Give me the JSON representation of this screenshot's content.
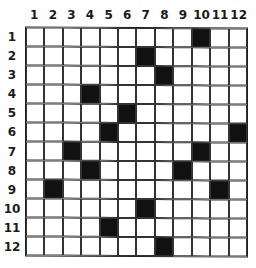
{
  "grid": {
    "rows": 12,
    "cols": 12,
    "column_labels": [
      "1",
      "2",
      "3",
      "4",
      "5",
      "6",
      "7",
      "8",
      "9",
      "10",
      "11",
      "12"
    ],
    "row_labels": [
      "1",
      "2",
      "3",
      "4",
      "5",
      "6",
      "7",
      "8",
      "9",
      "10",
      "11",
      "12"
    ],
    "filled_color": "#111111",
    "empty_color": "#ffffff",
    "filled_cells": [
      [
        1,
        10
      ],
      [
        2,
        7
      ],
      [
        3,
        8
      ],
      [
        4,
        4
      ],
      [
        5,
        6
      ],
      [
        6,
        5
      ],
      [
        6,
        12
      ],
      [
        7,
        3
      ],
      [
        7,
        10
      ],
      [
        8,
        4
      ],
      [
        8,
        9
      ],
      [
        9,
        2
      ],
      [
        9,
        11
      ],
      [
        10,
        7
      ],
      [
        11,
        5
      ],
      [
        12,
        8
      ]
    ]
  }
}
